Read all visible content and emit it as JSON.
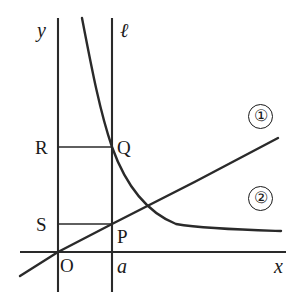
{
  "figure": {
    "background_color": "#ffffff",
    "stroke_color": "#1a1a1a",
    "axes": {
      "x_axis_label": "x",
      "y_axis_label": "y",
      "origin_label": "O",
      "x_axis_y": 252,
      "y_axis_x": 58,
      "x_axis_start": 20,
      "x_axis_end": 286,
      "y_axis_start": 18,
      "y_axis_end": 292
    },
    "vertical_line": {
      "label": "ℓ",
      "x_value_label": "a",
      "x_px": 112,
      "top_px": 18,
      "bottom_px": 292
    },
    "points": [
      {
        "name": "Q",
        "label": "Q",
        "x_px": 112,
        "y_px": 147
      },
      {
        "name": "P",
        "label": "P",
        "x_px": 112,
        "y_px": 224
      },
      {
        "name": "R",
        "label": "R",
        "x_px": 58,
        "y_px": 147
      },
      {
        "name": "S",
        "label": "S",
        "x_px": 58,
        "y_px": 224
      }
    ],
    "curves": [
      {
        "id": "1",
        "badge": "①",
        "type": "line",
        "description": "straight line through the origin with positive slope",
        "from_px": [
          20,
          276
        ],
        "to_px": [
          278,
          138
        ]
      },
      {
        "id": "2",
        "badge": "②",
        "type": "hyperbola",
        "description": "decreasing convex curve in the first quadrant",
        "from_px": [
          82,
          18
        ],
        "to_px": [
          281,
          231
        ]
      }
    ],
    "guide_lines": [
      {
        "name": "R-to-Q",
        "from_px": [
          58,
          147
        ],
        "to_px": [
          112,
          147
        ]
      },
      {
        "name": "S-to-P",
        "from_px": [
          58,
          224
        ],
        "to_px": [
          112,
          224
        ]
      }
    ],
    "badges": [
      {
        "id": "badge-1",
        "text": "①",
        "x_px": 248,
        "y_px": 104
      },
      {
        "id": "badge-2",
        "text": "②",
        "x_px": 248,
        "y_px": 186
      }
    ]
  }
}
